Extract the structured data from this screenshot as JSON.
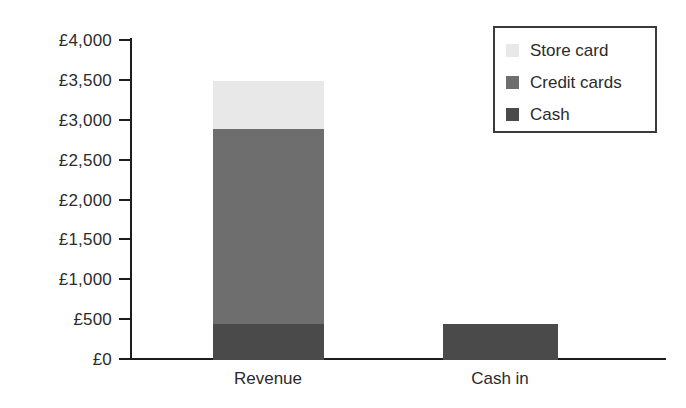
{
  "chart_data": {
    "type": "bar",
    "title": "",
    "subtitle": "",
    "xlabel": "",
    "ylabel": "",
    "stacked": true,
    "grid": false,
    "legend_position": "top-right",
    "categories": [
      "Revenue",
      "Cash in"
    ],
    "series": [
      {
        "name": "Cash",
        "values": [
          450,
          450
        ],
        "color": "#4a4a4a"
      },
      {
        "name": "Credit cards",
        "values": [
          2450,
          0
        ],
        "color": "#6e6e6e"
      },
      {
        "name": "Store card",
        "values": [
          600,
          0
        ],
        "color": "#e8e8e8"
      }
    ],
    "totals": [
      3500,
      450
    ],
    "ylim": [
      0,
      4000
    ],
    "ytick_values": [
      0,
      500,
      1000,
      1500,
      2000,
      2500,
      3000,
      3500,
      4000
    ],
    "ytick_labels": [
      "£0",
      "£500",
      "£1,000",
      "£1,500",
      "£2,000",
      "£2,500",
      "£3,000",
      "£3,500",
      "£4,000"
    ],
    "currency_symbol": "£",
    "axis_color": "#1c1c1c",
    "background_color": "#ffffff"
  },
  "legend": {
    "entries": [
      {
        "label": "Store card",
        "color": "#e8e8e8"
      },
      {
        "label": "Credit cards",
        "color": "#6e6e6e"
      },
      {
        "label": "Cash",
        "color": "#4a4a4a"
      }
    ]
  }
}
